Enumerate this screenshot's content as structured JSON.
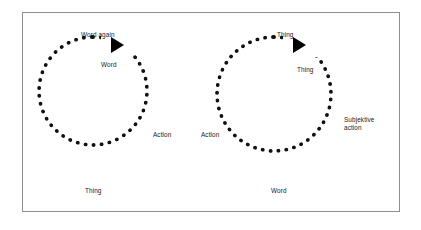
{
  "figure": {
    "background_color": "#ffffff",
    "frame_color": "#8e8e8e",
    "ink_color": "#111111"
  },
  "diagram": {
    "type": "two-cycle-dotted-loop-diagram",
    "cycles": [
      {
        "id": "left-cycle",
        "arrow_direction": "clockwise",
        "arrowhead": "solid-right-triangle",
        "labels": [
          {
            "name": "left-label-word-again",
            "text": "Word again",
            "position": "top"
          },
          {
            "name": "left-label-word",
            "text": "Word",
            "position": "inner-top-right"
          },
          {
            "name": "left-label-action",
            "text": "Action",
            "position": "right"
          },
          {
            "name": "left-label-thing",
            "text": "Thing",
            "position": "bottom-left-outside"
          }
        ]
      },
      {
        "id": "right-cycle",
        "arrow_direction": "clockwise",
        "arrowhead": "solid-right-triangle",
        "labels": [
          {
            "name": "right-label-thing-top",
            "text": "Thing",
            "position": "top"
          },
          {
            "name": "right-label-thing-inner",
            "text": "Thing",
            "position": "inner-top-right"
          },
          {
            "name": "right-label-subjektive-action",
            "text": "Subjektive\naction",
            "position": "right"
          },
          {
            "name": "right-label-action",
            "text": "Action",
            "position": "left"
          },
          {
            "name": "right-label-word",
            "text": "Word",
            "position": "bottom-outside"
          }
        ]
      }
    ]
  }
}
